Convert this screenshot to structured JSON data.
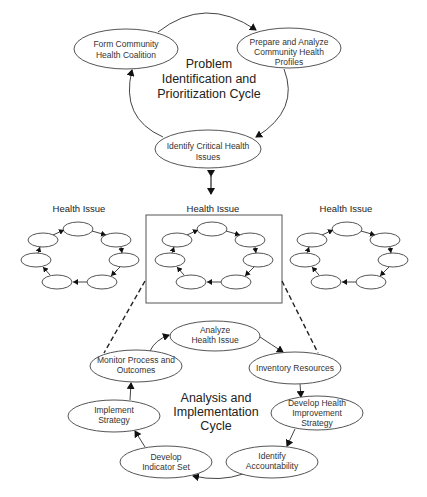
{
  "top_cycle": {
    "title_lines": [
      "Problem",
      "Identification and",
      "Prioritization Cycle"
    ],
    "nodes": {
      "form_coalition": [
        "Form Community",
        "Health Coalition"
      ],
      "prepare_profiles": [
        "Prepare and Analyze",
        "Community Health",
        "Profiles"
      ],
      "identify_issues": [
        "Identify Critical Health",
        "Issues"
      ]
    }
  },
  "health_issues": {
    "left_label": "Health Issue",
    "center_label": "Health Issue",
    "right_label": "Health Issue"
  },
  "bottom_cycle": {
    "title_lines": [
      "Analysis and",
      "Implementation",
      "Cycle"
    ],
    "nodes": {
      "analyze": [
        "Analyze",
        "Health Issue"
      ],
      "inventory": [
        "Inventory Resources"
      ],
      "develop_strategy": [
        "Develop Health",
        "Improvement",
        "Strategy"
      ],
      "accountability": [
        "Identify",
        "Accountability"
      ],
      "indicator": [
        "Develop",
        "Indicator Set"
      ],
      "implement": [
        "Implement",
        "Strategy"
      ],
      "monitor": [
        "Monitor Process and",
        "Outcomes"
      ]
    }
  },
  "colors": {
    "stroke": "#555555",
    "text": "#333333",
    "background": "#ffffff"
  }
}
